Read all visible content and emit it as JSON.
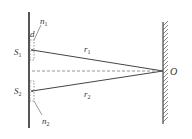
{
  "diagram": {
    "type": "double-slit-interference",
    "labels": {
      "s1": "S",
      "s1_sub": "1",
      "s2": "S",
      "s2_sub": "2",
      "n1": "n",
      "n1_sub": "1",
      "n2": "n",
      "n2_sub": "2",
      "d": "d",
      "r1": "r",
      "r1_sub": "1",
      "r2": "r",
      "r2_sub": "2",
      "o": "O"
    },
    "colors": {
      "line": "#444444",
      "dashed": "#666666",
      "text": "#333333",
      "background": "#ffffff"
    }
  }
}
